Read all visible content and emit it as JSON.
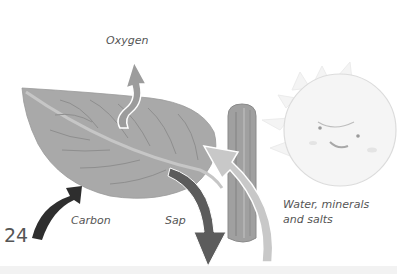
{
  "diagram": {
    "type": "photosynthesis-illustration",
    "page_number": "24",
    "labels": {
      "oxygen": "Oxygen",
      "carbon": "Carbon",
      "sap": "Sap",
      "water_line1": "Water, minerals",
      "water_line2": "and salts"
    },
    "elements": [
      "leaf",
      "stem",
      "sun-face",
      "oxygen-arrow",
      "carbon-arrow",
      "sap-arrow",
      "water-arrow"
    ],
    "colors": {
      "leaf": "#a9a9a9",
      "leaf_vein": "#8e8e8e",
      "stem": "#9a9a9a",
      "carbon_arrow": "#2e2e2e",
      "sap_arrow": "#5c5c5c",
      "water_arrow": "#c4c4c4",
      "oxygen_arrow": "#9c9c9c",
      "sun": "#f3f3f3",
      "text": "#555555"
    }
  }
}
